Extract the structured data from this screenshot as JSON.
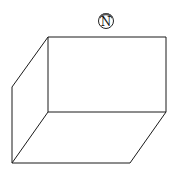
{
  "diagram": {
    "type": "3d-box-with-north-arrow",
    "compass": {
      "label": "N",
      "cx": 106,
      "cy": 21,
      "r": 8
    },
    "stroke_color": "#111111",
    "background": "#ffffff"
  }
}
